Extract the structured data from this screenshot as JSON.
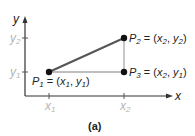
{
  "diagram": {
    "caption": "(a)",
    "axes": {
      "x_label": "x",
      "y_label": "y",
      "x_ticks": [
        {
          "base": "x",
          "sub": "1"
        },
        {
          "base": "x",
          "sub": "2"
        }
      ],
      "y_ticks": [
        {
          "base": "y",
          "sub": "2"
        },
        {
          "base": "y",
          "sub": "1"
        }
      ]
    },
    "points": [
      {
        "id": "P1",
        "name": "P",
        "sub": "1",
        "eq": " = (",
        "coords": [
          {
            "base": "x",
            "sub": "1"
          },
          {
            "base": "y",
            "sub": "1"
          }
        ]
      },
      {
        "id": "P2",
        "name": "P",
        "sub": "2",
        "eq": " = (",
        "coords": [
          {
            "base": "x",
            "sub": "2"
          },
          {
            "base": "y",
            "sub": "2"
          }
        ]
      },
      {
        "id": "P3",
        "name": "P",
        "sub": "3",
        "eq": " = (",
        "coords": [
          {
            "base": "x",
            "sub": "2"
          },
          {
            "base": "y",
            "sub": "1"
          }
        ]
      }
    ],
    "colors": {
      "axis": "#333333",
      "hypotenuse": "#555555",
      "legs": "#aaaaaa",
      "tick_label": "#b5b5b5",
      "point": "#111111"
    }
  }
}
